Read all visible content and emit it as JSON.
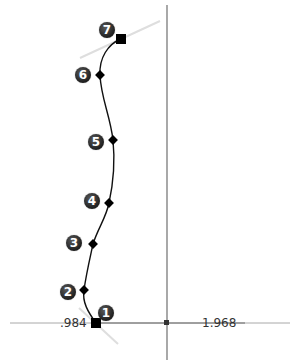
{
  "sketch": {
    "axes": {
      "horizontal": {
        "y": 323,
        "x1": 10,
        "x2": 290,
        "color": "#9a9a9a"
      },
      "vertical": {
        "x": 167,
        "y1": 5,
        "y2": 360,
        "color": "#7a7a7a"
      },
      "origin": {
        "x": 166,
        "y": 323
      }
    },
    "dimensions": [
      {
        "label": ".984",
        "x": 60,
        "y": 317
      },
      {
        "label": "1.968",
        "x": 202,
        "y": 317
      }
    ],
    "points": [
      {
        "id": "1",
        "badge": "1",
        "x": 96,
        "y": 323,
        "shape": "square",
        "badge_x": 106,
        "badge_y": 313
      },
      {
        "id": "2",
        "badge": "2",
        "x": 84,
        "y": 290,
        "shape": "diamond",
        "badge_x": 68,
        "badge_y": 292
      },
      {
        "id": "3",
        "badge": "3",
        "x": 93,
        "y": 244,
        "shape": "diamond",
        "badge_x": 74,
        "badge_y": 243
      },
      {
        "id": "4",
        "badge": "4",
        "x": 109,
        "y": 203,
        "shape": "diamond",
        "badge_x": 92,
        "badge_y": 201
      },
      {
        "id": "5",
        "badge": "5",
        "x": 113,
        "y": 140,
        "shape": "diamond",
        "badge_x": 96,
        "badge_y": 142
      },
      {
        "id": "6",
        "badge": "6",
        "x": 100,
        "y": 75,
        "shape": "diamond",
        "badge_x": 83,
        "badge_y": 75
      },
      {
        "id": "7",
        "badge": "7",
        "x": 121,
        "y": 39,
        "shape": "square",
        "badge_x": 107,
        "badge_y": 30
      }
    ],
    "tangent_handles": [
      {
        "x1": 80,
        "y1": 58,
        "x2": 160,
        "y2": 21
      },
      {
        "x1": 79,
        "y1": 308,
        "x2": 118,
        "y2": 344
      }
    ],
    "colors": {
      "curve": "#111111",
      "tangent": "#dcdcdc",
      "badge_fill": "#2a2a2a",
      "badge_text": "#ffffff"
    }
  }
}
